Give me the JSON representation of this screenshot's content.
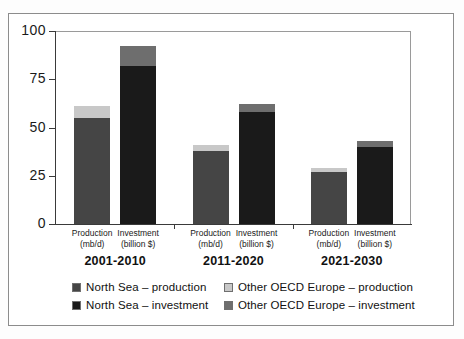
{
  "chart_data": {
    "type": "bar",
    "title": "",
    "subtitle": "",
    "xlabel": "",
    "ylabel": "",
    "ylim": [
      0,
      100
    ],
    "yticks": [
      0,
      25,
      50,
      75,
      100
    ],
    "grid": false,
    "stacked": true,
    "legend_position": "bottom",
    "groups": [
      "2001-2010",
      "2011-2020",
      "2021-2030"
    ],
    "categories": [
      "Production (mb/d)",
      "Investment (billion $)",
      "Production (mb/d)",
      "Investment (billion $)",
      "Production (mb/d)",
      "Investment (billion $)"
    ],
    "series": [
      {
        "name": "North Sea – production",
        "color": "#454545",
        "values": [
          55,
          null,
          38,
          null,
          27,
          null
        ]
      },
      {
        "name": "Other OECD Europe – production",
        "color": "#c8c8c8",
        "values": [
          6,
          null,
          3,
          null,
          2,
          null
        ]
      },
      {
        "name": "North Sea – investment",
        "color": "#1a1a1a",
        "values": [
          null,
          82,
          null,
          58,
          null,
          40
        ]
      },
      {
        "name": "Other OECD Europe – investment",
        "color": "#6e6e6e",
        "values": [
          null,
          10,
          null,
          4,
          null,
          3
        ]
      }
    ],
    "bars": [
      {
        "group": "2001-2010",
        "label_line1": "Production",
        "label_line2": "(mb/d)",
        "kind": "production",
        "total": 61,
        "segments": [
          {
            "series": "North Sea – production",
            "value": 55,
            "color": "#454545"
          },
          {
            "series": "Other OECD Europe – production",
            "value": 6,
            "color": "#c8c8c8"
          }
        ]
      },
      {
        "group": "2001-2010",
        "label_line1": "Investment",
        "label_line2": "(billion $)",
        "kind": "investment",
        "total": 92,
        "segments": [
          {
            "series": "North Sea – investment",
            "value": 82,
            "color": "#1a1a1a"
          },
          {
            "series": "Other OECD Europe – investment",
            "value": 10,
            "color": "#6e6e6e"
          }
        ]
      },
      {
        "group": "2011-2020",
        "label_line1": "Production",
        "label_line2": "(mb/d)",
        "kind": "production",
        "total": 41,
        "segments": [
          {
            "series": "North Sea – production",
            "value": 38,
            "color": "#454545"
          },
          {
            "series": "Other OECD Europe – production",
            "value": 3,
            "color": "#c8c8c8"
          }
        ]
      },
      {
        "group": "2011-2020",
        "label_line1": "Investment",
        "label_line2": "(billion $)",
        "kind": "investment",
        "total": 62,
        "segments": [
          {
            "series": "North Sea – investment",
            "value": 58,
            "color": "#1a1a1a"
          },
          {
            "series": "Other OECD Europe – investment",
            "value": 4,
            "color": "#6e6e6e"
          }
        ]
      },
      {
        "group": "2021-2030",
        "label_line1": "Production",
        "label_line2": "(mb/d)",
        "kind": "production",
        "total": 29,
        "segments": [
          {
            "series": "North Sea – production",
            "value": 27,
            "color": "#454545"
          },
          {
            "series": "Other OECD Europe – production",
            "value": 2,
            "color": "#c8c8c8"
          }
        ]
      },
      {
        "group": "2021-2030",
        "label_line1": "Investment",
        "label_line2": "(billion $)",
        "kind": "investment",
        "total": 43,
        "segments": [
          {
            "series": "North Sea – investment",
            "value": 40,
            "color": "#1a1a1a"
          },
          {
            "series": "Other OECD Europe – investment",
            "value": 3,
            "color": "#6e6e6e"
          }
        ]
      }
    ]
  },
  "axis": {
    "y_tick_labels": [
      "100",
      "75",
      "50",
      "25",
      "0"
    ]
  },
  "legend": {
    "items": [
      {
        "label": "North Sea – production",
        "color": "#454545"
      },
      {
        "label": "Other OECD Europe – production",
        "color": "#c8c8c8"
      },
      {
        "label": "North Sea – investment",
        "color": "#1a1a1a"
      },
      {
        "label": "Other OECD Europe – investment",
        "color": "#6e6e6e"
      }
    ]
  },
  "colors": {
    "north_sea_production": "#454545",
    "other_oecd_production": "#c8c8c8",
    "north_sea_investment": "#1a1a1a",
    "other_oecd_investment": "#6e6e6e",
    "frame": "#8c8c8c",
    "axis": "#3a3a3a",
    "text": "#111111"
  }
}
